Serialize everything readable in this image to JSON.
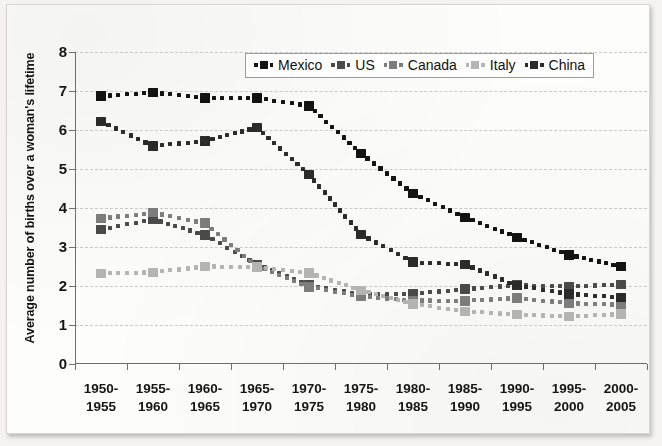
{
  "chart_data": {
    "type": "line",
    "title": "",
    "xlabel": "",
    "ylabel": "Average number of births over a woman's lifetime",
    "ylim": [
      0,
      8
    ],
    "yticks": [
      0,
      1,
      2,
      3,
      4,
      5,
      6,
      7,
      8
    ],
    "ytick_labels": [
      "0",
      "1",
      "2",
      "3",
      "4",
      "5",
      "6",
      "7",
      "8"
    ],
    "grid": true,
    "legend_position": "top-center",
    "categories": [
      "1950-1955",
      "1955-1960",
      "1960-1965",
      "1965-1970",
      "1970-1975",
      "1975-1980",
      "1980-1985",
      "1985-1990",
      "1990-1995",
      "1995-2000",
      "2000-2005"
    ],
    "category_lines": [
      [
        "1950-",
        "1955"
      ],
      [
        "1955-",
        "1960"
      ],
      [
        "1960-",
        "1965"
      ],
      [
        "1965-",
        "1970"
      ],
      [
        "1970-",
        "1975"
      ],
      [
        "1975-",
        "1980"
      ],
      [
        "1980-",
        "1985"
      ],
      [
        "1985-",
        "1990"
      ],
      [
        "1990-",
        "1995"
      ],
      [
        "1995-",
        "2000"
      ],
      [
        "2000-",
        "2005"
      ]
    ],
    "series": [
      {
        "name": "Mexico",
        "color": "#131313",
        "values": [
          6.87,
          6.96,
          6.82,
          6.82,
          6.62,
          5.4,
          4.37,
          3.76,
          3.25,
          2.8,
          2.5
        ]
      },
      {
        "name": "US",
        "color": "#4a4a4a",
        "values": [
          3.45,
          3.71,
          3.31,
          2.55,
          2.02,
          1.79,
          1.8,
          1.92,
          2.02,
          1.99,
          2.04
        ]
      },
      {
        "name": "Canada",
        "color": "#7d7d7d",
        "values": [
          3.73,
          3.88,
          3.61,
          2.5,
          1.98,
          1.73,
          1.63,
          1.62,
          1.69,
          1.56,
          1.52
        ]
      },
      {
        "name": "Italy",
        "color": "#b4b4b4",
        "values": [
          2.32,
          2.35,
          2.5,
          2.49,
          2.33,
          1.89,
          1.54,
          1.35,
          1.27,
          1.22,
          1.28
        ]
      },
      {
        "name": "China",
        "color": "#2b2b2b",
        "values": [
          6.22,
          5.59,
          5.72,
          6.06,
          4.86,
          3.32,
          2.61,
          2.55,
          2.01,
          1.8,
          1.7
        ]
      }
    ]
  },
  "legend": {
    "items": [
      {
        "label": "Mexico",
        "color": "#131313"
      },
      {
        "label": "US",
        "color": "#4a4a4a"
      },
      {
        "label": "Canada",
        "color": "#7d7d7d"
      },
      {
        "label": "Italy",
        "color": "#b4b4b4"
      },
      {
        "label": "China",
        "color": "#2b2b2b"
      }
    ]
  }
}
